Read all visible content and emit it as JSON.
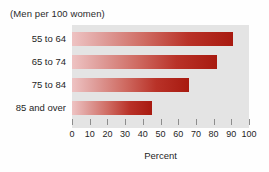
{
  "chart_data": {
    "type": "bar",
    "orientation": "horizontal",
    "title": "(Men per 100 women)",
    "xlabel": "Percent",
    "ylabel": "",
    "categories": [
      "55 to 64",
      "65 to 74",
      "75 to 84",
      "85 and over"
    ],
    "values": [
      91,
      82,
      66,
      45
    ],
    "xlim": [
      0,
      100
    ],
    "xticks": [
      0,
      10,
      20,
      30,
      40,
      50,
      60,
      70,
      80,
      90,
      100
    ],
    "xtick_labels": [
      "0",
      "10",
      "20",
      "30",
      "40",
      "50",
      "60",
      "70",
      "80",
      "90",
      "100"
    ],
    "grid": false,
    "legend": null,
    "colors": {
      "bar_gradient_start": "#eec3c3",
      "bar_gradient_end": "#a81a10",
      "plot_background": "#e4e4e4",
      "page_background": "#fefefe",
      "text": "#1f1f1f",
      "tick": "#8d8d8d"
    }
  }
}
